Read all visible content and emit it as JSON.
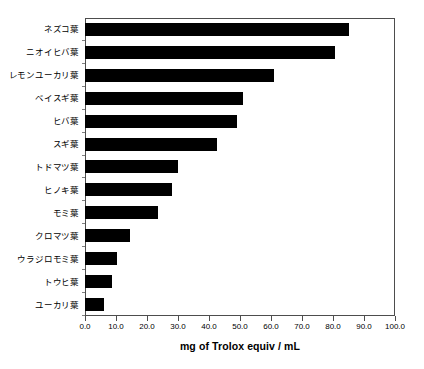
{
  "chart_data": {
    "type": "bar",
    "orientation": "horizontal",
    "title": "",
    "xlabel": "mg of Trolox equiv / mL",
    "ylabel": "",
    "xlim": [
      0.0,
      100.0
    ],
    "xticks": [
      "0.0",
      "10.0",
      "20.0",
      "30.0",
      "40.0",
      "50.0",
      "60.0",
      "70.0",
      "80.0",
      "90.0",
      "100.0"
    ],
    "xtick_values": [
      0,
      10,
      20,
      30,
      40,
      50,
      60,
      70,
      80,
      90,
      100
    ],
    "grid": false,
    "legend": null,
    "bar_color": "#000000",
    "categories": [
      "ネズコ葉",
      "ニオイヒバ葉",
      "レモンユーカリ葉",
      "ベイスギ葉",
      "ヒバ葉",
      "スギ葉",
      "トドマツ葉",
      "ヒノキ葉",
      "モミ葉",
      "クロマツ葉",
      "ウラジロモミ葉",
      "トウヒ葉",
      "ユーカリ葉"
    ],
    "values": [
      85.0,
      80.5,
      61.0,
      51.0,
      49.0,
      42.5,
      30.0,
      28.0,
      23.5,
      14.5,
      10.3,
      8.8,
      6.0
    ]
  }
}
